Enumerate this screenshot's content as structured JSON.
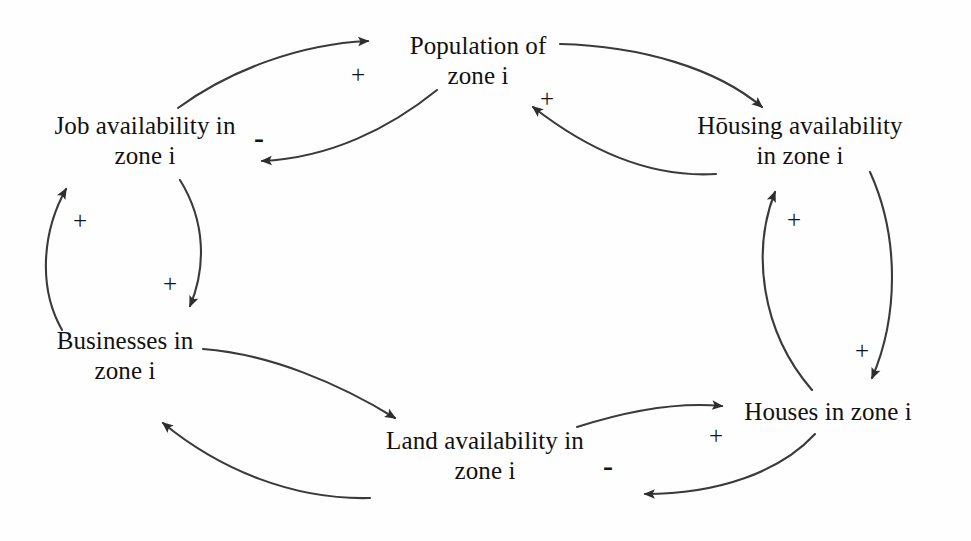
{
  "diagram": {
    "line_color": "#3a3a3a",
    "text_color": "#111111",
    "background": "#fefefe",
    "nodes": [
      {
        "id": "population",
        "name": "population-of-zone-i",
        "line1": "Population of",
        "line2": "zone i",
        "x": 478,
        "y": 60
      },
      {
        "id": "job_availability",
        "name": "job-availability-in-zone-i",
        "line1": "Job availability in",
        "line2": "zone i",
        "x": 145,
        "y": 140
      },
      {
        "id": "housing_availability",
        "name": "housing-availability-in-zone-i",
        "line1": "Hōusing availability",
        "line2": "in zone i",
        "x": 800,
        "y": 140
      },
      {
        "id": "businesses",
        "name": "businesses-in-zone-i",
        "line1": "Businesses in",
        "line2": "zone i",
        "x": 125,
        "y": 355
      },
      {
        "id": "land_availability",
        "name": "land-availability-in-zone-i",
        "line1": "Land availability in",
        "line2": "zone i",
        "x": 485,
        "y": 455
      },
      {
        "id": "houses",
        "name": "houses-in-zone-i",
        "line1": "Houses in zone i",
        "line2": "",
        "x": 828,
        "y": 412
      }
    ],
    "edges": [
      {
        "id": "job_to_population",
        "name": "edge-job-availability-to-population",
        "from": "job_availability",
        "to": "population",
        "polarity": "+",
        "sign_x": 358,
        "sign_y": 74
      },
      {
        "id": "population_to_job",
        "name": "edge-population-to-job-availability",
        "from": "population",
        "to": "job_availability",
        "polarity": "-",
        "sign_x": 259,
        "sign_y": 138
      },
      {
        "id": "population_to_housing",
        "name": "edge-population-to-housing-availability",
        "from": "population",
        "to": "housing_availability",
        "polarity": "",
        "sign_x": 0,
        "sign_y": 0
      },
      {
        "id": "housing_to_population",
        "name": "edge-housing-availability-to-population",
        "from": "housing_availability",
        "to": "population",
        "polarity": "+",
        "sign_x": 547,
        "sign_y": 98
      },
      {
        "id": "businesses_to_job",
        "name": "edge-businesses-to-job-availability",
        "from": "businesses",
        "to": "job_availability",
        "polarity": "+",
        "sign_x": 80,
        "sign_y": 220
      },
      {
        "id": "job_to_businesses",
        "name": "edge-job-availability-to-businesses",
        "from": "job_availability",
        "to": "businesses",
        "polarity": "+",
        "sign_x": 170,
        "sign_y": 283
      },
      {
        "id": "businesses_to_land",
        "name": "edge-businesses-to-land-availability",
        "from": "businesses",
        "to": "land_availability",
        "polarity": "",
        "sign_x": 0,
        "sign_y": 0
      },
      {
        "id": "land_to_businesses",
        "name": "edge-land-availability-to-businesses",
        "from": "land_availability",
        "to": "businesses",
        "polarity": "",
        "sign_x": 0,
        "sign_y": 0
      },
      {
        "id": "land_to_houses",
        "name": "edge-land-availability-to-houses",
        "from": "land_availability",
        "to": "houses",
        "polarity": "+",
        "sign_x": 716,
        "sign_y": 435
      },
      {
        "id": "houses_to_land",
        "name": "edge-houses-to-land-availability",
        "from": "houses",
        "to": "land_availability",
        "polarity": "-",
        "sign_x": 608,
        "sign_y": 466
      },
      {
        "id": "houses_to_housing",
        "name": "edge-houses-to-housing-availability",
        "from": "houses",
        "to": "housing_availability",
        "polarity": "+",
        "sign_x": 794,
        "sign_y": 219
      },
      {
        "id": "housing_to_houses",
        "name": "edge-housing-availability-to-houses",
        "from": "housing_availability",
        "to": "houses",
        "polarity": "+",
        "sign_x": 862,
        "sign_y": 350
      }
    ]
  }
}
